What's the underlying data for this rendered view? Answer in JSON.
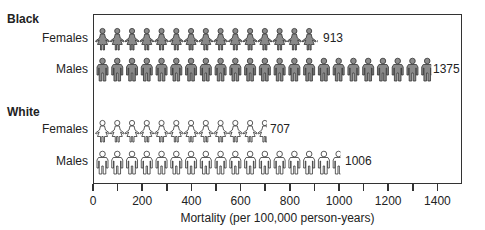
{
  "chart_data": {
    "type": "bar",
    "style": "pictograph",
    "title": "",
    "xlabel": "Mortality (per 100,000 person-years)",
    "ylabel": "",
    "xlim": [
      0,
      1500
    ],
    "x_ticks": [
      0,
      200,
      400,
      600,
      800,
      1000,
      1200,
      1400
    ],
    "minor_ticks_every": 100,
    "groups": [
      {
        "name": "Black",
        "rows": [
          {
            "label": "Females",
            "value": 913,
            "icon": "female-figure",
            "fill": "#8a8a8a"
          },
          {
            "label": "Males",
            "value": 1375,
            "icon": "male-figure",
            "fill": "#8a8a8a"
          }
        ]
      },
      {
        "name": "White",
        "rows": [
          {
            "label": "Females",
            "value": 707,
            "icon": "female-figure",
            "fill": "#ffffff"
          },
          {
            "label": "Males",
            "value": 1006,
            "icon": "male-figure",
            "fill": "#ffffff"
          }
        ]
      }
    ],
    "icon_unit": 60,
    "grid": false,
    "legend": "none"
  },
  "labels": {
    "black": "Black",
    "white": "White",
    "females": "Females",
    "males": "Males",
    "v_bf": "913",
    "v_bm": "1375",
    "v_wf": "707",
    "v_wm": "1006",
    "xlabel": "Mortality (per 100,000 person-years)",
    "ticks": [
      "0",
      "200",
      "400",
      "600",
      "800",
      "1000",
      "1200",
      "1400"
    ]
  }
}
